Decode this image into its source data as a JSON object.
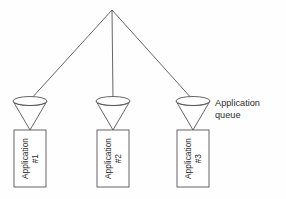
{
  "diagram": {
    "background_color": "#fefefe",
    "stroke_color": "#555555",
    "text_color": "#2b2b2b",
    "source": {
      "name": "source-node",
      "x": 112,
      "y": 10
    },
    "annotation": {
      "name": "application-queue-label",
      "line1": "Application",
      "line2": "queue",
      "x": 215,
      "y": 98
    },
    "funnels": [
      {
        "name": "funnel-1",
        "cx": 30,
        "top_y": 101,
        "tip_y": 130,
        "rx": 17,
        "ry": 4.5
      },
      {
        "name": "funnel-2",
        "cx": 113,
        "top_y": 101,
        "tip_y": 130,
        "rx": 17,
        "ry": 4.5
      },
      {
        "name": "funnel-3",
        "cx": 193,
        "top_y": 101,
        "tip_y": 130,
        "rx": 17,
        "ry": 4.5
      }
    ],
    "boxes": [
      {
        "name": "application-box-1",
        "label": "Application",
        "sublabel": "#1",
        "x": 14,
        "y": 130,
        "width": 32,
        "height": 57
      },
      {
        "name": "application-box-2",
        "label": "Application",
        "sublabel": "#2",
        "x": 97,
        "y": 130,
        "width": 32,
        "height": 57
      },
      {
        "name": "application-box-3",
        "label": "Application",
        "sublabel": "#3",
        "x": 177,
        "y": 130,
        "width": 32,
        "height": 57
      }
    ],
    "connectors": [
      {
        "name": "connector-to-funnel-1",
        "x1": 112,
        "y1": 10,
        "x2": 30,
        "y2": 100
      },
      {
        "name": "connector-to-funnel-2",
        "x1": 112,
        "y1": 10,
        "x2": 113,
        "y2": 100
      },
      {
        "name": "connector-to-funnel-3",
        "x1": 112,
        "y1": 10,
        "x2": 193,
        "y2": 100
      }
    ]
  }
}
